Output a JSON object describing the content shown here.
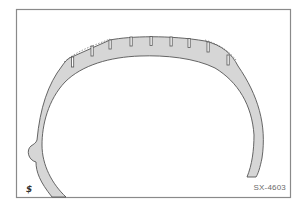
{
  "figure": {
    "code": "SX-4603",
    "corner_mark": "$",
    "colors": {
      "frame": "#8a8a8a",
      "tire_fill": "#d6d6d6",
      "outline": "#555555",
      "background": "#ffffff"
    },
    "tread_groove_count": 9,
    "wear_line_style": "dashed"
  }
}
